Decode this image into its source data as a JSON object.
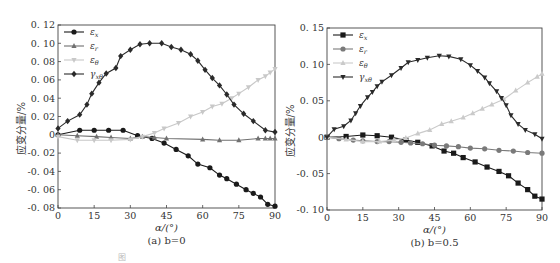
{
  "figure_caption_partial": "图",
  "chart_data": [
    {
      "type": "line",
      "panel": "a",
      "caption": "(a) b=0",
      "xlabel": "α/(°)",
      "ylabel": "应变分量/%",
      "xlim": [
        0,
        90
      ],
      "ylim": [
        -0.08,
        0.12
      ],
      "xticks": [
        0,
        15,
        30,
        45,
        60,
        75,
        90
      ],
      "yticks": [
        -0.08,
        -0.06,
        -0.04,
        -0.02,
        0,
        0.02,
        0.04,
        0.06,
        0.08,
        0.1,
        0.12
      ],
      "ytick_labels": [
        "-0.08",
        "-0.06",
        "-0.04",
        "-0.02",
        "0",
        "0.02",
        "0.04",
        "0.06",
        "0.08",
        "0.10",
        "0.12"
      ],
      "grid": false,
      "legend_position": "upper left",
      "series": [
        {
          "name": "εx",
          "marker": "circle",
          "color": "#1a1a1a",
          "x": [
            0,
            9,
            15,
            21,
            27,
            33,
            39,
            44,
            49,
            54,
            58,
            63,
            67,
            70,
            74,
            78,
            81,
            84,
            87,
            90
          ],
          "y": [
            0,
            0.005,
            0.005,
            0.005,
            0.005,
            -0.001,
            -0.004,
            -0.009,
            -0.016,
            -0.023,
            -0.032,
            -0.036,
            -0.044,
            -0.048,
            -0.054,
            -0.06,
            -0.064,
            -0.068,
            -0.076,
            -0.078
          ]
        },
        {
          "name": "εr",
          "marker": "triangle-up",
          "color": "#707070",
          "x": [
            0,
            8,
            16,
            22,
            30,
            35,
            40,
            45,
            60,
            67,
            75,
            83,
            86,
            88,
            90
          ],
          "y": [
            0,
            -0.001,
            -0.002,
            -0.003,
            -0.004,
            -0.002,
            -0.003,
            -0.004,
            -0.005,
            -0.006,
            -0.006,
            -0.004,
            -0.004,
            -0.004,
            -0.004
          ]
        },
        {
          "name": "εθ",
          "marker": "triangle-down",
          "color": "#c8c8c8",
          "x": [
            0,
            8,
            15,
            22,
            30,
            35,
            40,
            44,
            50,
            55,
            60,
            64,
            68,
            72,
            75,
            79,
            83,
            86,
            88,
            90
          ],
          "y": [
            -0.002,
            -0.006,
            -0.006,
            -0.006,
            -0.005,
            -0.002,
            0.002,
            0.007,
            0.013,
            0.02,
            0.025,
            0.031,
            0.034,
            0.04,
            0.045,
            0.052,
            0.06,
            0.064,
            0.068,
            0.072
          ]
        },
        {
          "name": "γxθ",
          "marker": "diamond",
          "color": "#2a2a2a",
          "x": [
            0,
            4,
            9,
            12,
            14,
            17,
            20,
            24,
            26,
            30,
            34,
            38,
            43,
            47,
            51,
            55,
            58,
            61,
            64,
            67,
            70,
            73,
            77,
            81,
            86,
            90
          ],
          "y": [
            0.007,
            0.015,
            0.022,
            0.033,
            0.045,
            0.057,
            0.067,
            0.073,
            0.086,
            0.093,
            0.099,
            0.1,
            0.1,
            0.096,
            0.093,
            0.088,
            0.081,
            0.071,
            0.062,
            0.054,
            0.044,
            0.033,
            0.023,
            0.015,
            0.005,
            0.003
          ]
        }
      ]
    },
    {
      "type": "line",
      "panel": "b",
      "caption": "(b) b=0.5",
      "xlabel": "α/(°)",
      "ylabel": "应变分量/%",
      "xlim": [
        0,
        90
      ],
      "ylim": [
        -0.1,
        0.15
      ],
      "xticks": [
        0,
        15,
        30,
        45,
        60,
        75,
        90
      ],
      "yticks": [
        -0.1,
        -0.05,
        0,
        0.05,
        0.1,
        0.15
      ],
      "ytick_labels": [
        "-0.10",
        "-0.05",
        "0",
        "0.05",
        "0.10",
        "0.15"
      ],
      "grid": false,
      "legend_position": "upper left",
      "series": [
        {
          "name": "εx",
          "marker": "square",
          "color": "#1a1a1a",
          "x": [
            0,
            8,
            15,
            21,
            27,
            33,
            38,
            44,
            49,
            53,
            57,
            62,
            67,
            72,
            76,
            80,
            84,
            87,
            90
          ],
          "y": [
            0,
            0.001,
            0.003,
            0.002,
            0.0,
            -0.004,
            -0.007,
            -0.012,
            -0.019,
            -0.022,
            -0.028,
            -0.034,
            -0.041,
            -0.047,
            -0.053,
            -0.063,
            -0.072,
            -0.081,
            -0.085
          ]
        },
        {
          "name": "εr",
          "marker": "circle",
          "color": "#7a7a7a",
          "x": [
            0,
            5,
            11,
            15,
            21,
            26,
            31,
            35,
            40,
            45,
            50,
            55,
            60,
            66,
            72,
            78,
            84,
            90
          ],
          "y": [
            0,
            -0.002,
            -0.004,
            -0.005,
            -0.006,
            -0.006,
            -0.007,
            -0.008,
            -0.009,
            -0.011,
            -0.012,
            -0.013,
            -0.015,
            -0.016,
            -0.018,
            -0.019,
            -0.021,
            -0.022
          ]
        },
        {
          "name": "εθ",
          "marker": "triangle-up",
          "color": "#cacaca",
          "x": [
            0,
            8,
            15,
            22,
            28,
            33,
            38,
            43,
            48,
            52,
            57,
            61,
            65,
            69,
            74,
            79,
            84,
            88,
            90
          ],
          "y": [
            0,
            -0.003,
            -0.006,
            -0.006,
            -0.004,
            -0.001,
            0.005,
            0.01,
            0.018,
            0.022,
            0.027,
            0.033,
            0.039,
            0.045,
            0.052,
            0.064,
            0.075,
            0.083,
            0.087
          ]
        },
        {
          "name": "γxθ",
          "marker": "triangle-down",
          "color": "#2a2a2a",
          "x": [
            0,
            3,
            7,
            10,
            12,
            14,
            17,
            19,
            21,
            23,
            27,
            31,
            34,
            38,
            42,
            47,
            51,
            56,
            60,
            63,
            66,
            68,
            71,
            73,
            75,
            77,
            80,
            83,
            87,
            90
          ],
          "y": [
            0,
            0.011,
            0.015,
            0.023,
            0.033,
            0.043,
            0.055,
            0.062,
            0.07,
            0.076,
            0.085,
            0.095,
            0.103,
            0.106,
            0.109,
            0.112,
            0.111,
            0.107,
            0.099,
            0.091,
            0.082,
            0.074,
            0.063,
            0.054,
            0.044,
            0.03,
            0.018,
            0.01,
            0.004,
            -0.002
          ]
        }
      ]
    }
  ],
  "legend_labels": [
    "εx",
    "εr",
    "εθ",
    "γxθ"
  ]
}
